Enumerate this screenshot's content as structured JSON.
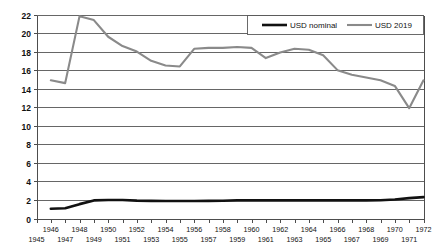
{
  "chart_data": {
    "type": "line",
    "title": "",
    "subtitle": "",
    "xlabel": "",
    "ylabel": "",
    "xlim": [
      1945,
      1972
    ],
    "ylim": [
      0,
      22
    ],
    "grid": true,
    "legend_position": "top-right",
    "x": [
      1946,
      1947,
      1948,
      1949,
      1950,
      1951,
      1952,
      1953,
      1954,
      1955,
      1956,
      1957,
      1958,
      1959,
      1960,
      1961,
      1962,
      1963,
      1964,
      1965,
      1966,
      1967,
      1968,
      1969,
      1970,
      1971,
      1972
    ],
    "y_ticks": [
      0,
      2,
      4,
      6,
      8,
      10,
      12,
      14,
      16,
      18,
      20,
      22
    ],
    "x_ticks_upper": [
      1946,
      1948,
      1950,
      1952,
      1954,
      1956,
      1958,
      1960,
      1962,
      1964,
      1966,
      1968,
      1970,
      1972
    ],
    "x_ticks_lower": [
      1945,
      1947,
      1949,
      1951,
      1953,
      1955,
      1957,
      1959,
      1961,
      1963,
      1965,
      1967,
      1969,
      1971
    ],
    "series": [
      {
        "name": "USD nominal",
        "color": "#111111",
        "values": [
          1.05,
          1.1,
          1.55,
          1.95,
          2.0,
          2.0,
          1.93,
          1.9,
          1.88,
          1.88,
          1.88,
          1.9,
          1.92,
          1.95,
          1.95,
          1.95,
          1.95,
          1.95,
          1.95,
          1.95,
          1.95,
          1.95,
          1.95,
          1.97,
          2.05,
          2.2,
          2.3
        ]
      },
      {
        "name": "USD 2019",
        "color": "#8a8a8a",
        "values": [
          14.9,
          14.6,
          21.8,
          21.4,
          19.6,
          18.6,
          18.0,
          17.0,
          16.5,
          16.4,
          18.3,
          18.4,
          18.4,
          18.5,
          18.4,
          17.3,
          17.9,
          18.3,
          18.2,
          17.6,
          16.0,
          15.5,
          15.2,
          14.9,
          14.3,
          11.9,
          14.9
        ]
      }
    ]
  },
  "legend": {
    "items": [
      {
        "label": "USD nominal"
      },
      {
        "label": "USD 2019"
      }
    ]
  }
}
